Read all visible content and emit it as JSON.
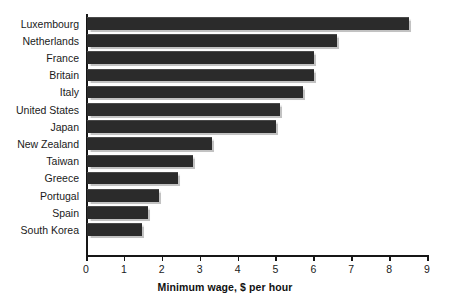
{
  "chart_data": {
    "type": "bar",
    "orientation": "horizontal",
    "title": "",
    "xlabel": "Minimum wage, $ per hour",
    "ylabel": "",
    "xlim": [
      0,
      9
    ],
    "xticks": [
      "0",
      "1",
      "2",
      "3",
      "4",
      "5",
      "6",
      "7",
      "8",
      "9"
    ],
    "grid": false,
    "legend": null,
    "bar_color": "#2b2b2b",
    "categories": [
      "Luxembourg",
      "Netherlands",
      "France",
      "Britain",
      "Italy",
      "United States",
      "Japan",
      "New Zealand",
      "Taiwan",
      "Greece",
      "Portugal",
      "Spain",
      "South Korea"
    ],
    "values": [
      8.5,
      6.6,
      6.0,
      6.0,
      5.7,
      5.1,
      5.0,
      3.3,
      2.8,
      2.4,
      1.9,
      1.6,
      1.45
    ]
  }
}
